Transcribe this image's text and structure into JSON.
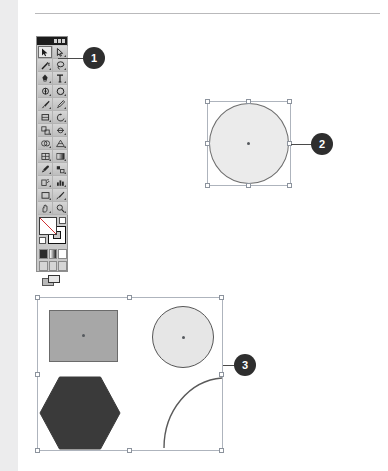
{
  "page": {
    "background": "#ffffff",
    "gutter_color": "#ececed",
    "rule_color": "#b9b9bb"
  },
  "toolbar": {
    "name": "Tools panel",
    "title_bar_color": "#1b1b1b",
    "panel_color": "#c9c9c9",
    "selected_tool": "selection-tool",
    "tools": [
      {
        "row": 0,
        "left": "selection-tool",
        "right": "direct-selection-tool"
      },
      {
        "row": 1,
        "left": "magic-wand-tool",
        "right": "lasso-tool"
      },
      {
        "row": 2,
        "left": "pen-tool",
        "right": "type-tool"
      },
      {
        "row": 3,
        "left": "line-segment-tool",
        "right": "ellipse-tool"
      },
      {
        "row": 4,
        "left": "paintbrush-tool",
        "right": "pencil-tool"
      },
      {
        "row": 5,
        "left": "eraser-tool",
        "right": "rotate-tool"
      },
      {
        "row": 6,
        "left": "scale-tool",
        "right": "width-tool"
      },
      {
        "row": 7,
        "left": "shape-builder-tool",
        "right": "perspective-grid-tool"
      },
      {
        "row": 8,
        "left": "mesh-tool",
        "right": "gradient-tool"
      },
      {
        "row": 9,
        "left": "eyedropper-tool",
        "right": "blend-tool"
      },
      {
        "row": 10,
        "left": "symbol-sprayer-tool",
        "right": "column-graph-tool"
      },
      {
        "row": 11,
        "left": "artboard-tool",
        "right": "slice-tool"
      },
      {
        "row": 12,
        "left": "hand-tool",
        "right": "zoom-tool"
      }
    ],
    "fill_stroke": {
      "fill_label": "Fill: None",
      "stroke_label": "Stroke: Gray"
    },
    "paint_modes": [
      "color-mode",
      "gradient-mode",
      "none-mode"
    ],
    "drawing_modes": [
      "draw-normal",
      "draw-behind",
      "draw-inside"
    ],
    "screen_mode": "change-screen-mode"
  },
  "callouts": [
    {
      "number": "1",
      "target": "selection-tool"
    },
    {
      "number": "2",
      "target": "selected-circle"
    },
    {
      "number": "3",
      "target": "selected-shape-group"
    }
  ],
  "artwork": {
    "circle_selection": {
      "name": "selected-circle",
      "shape": "circle",
      "fill": "#ebebeb",
      "stroke": "#6e6e6e",
      "handles": 8,
      "has_center_point": true
    },
    "group_selection": {
      "name": "selected-shape-group",
      "handles": 8,
      "has_center_point": false,
      "objects": [
        {
          "name": "gray-rectangle",
          "shape": "rectangle",
          "fill": "#a7a7a7",
          "stroke": "#6b6b6b",
          "has_center_point": true
        },
        {
          "name": "light-circle",
          "shape": "circle",
          "fill": "#e6e6e6",
          "stroke": "#565656",
          "has_center_point": true
        },
        {
          "name": "dark-hexagon",
          "shape": "hexagon",
          "fill": "#3a3a3a",
          "stroke": "#3a3a3a",
          "has_center_point": false
        },
        {
          "name": "quarter-arc",
          "shape": "arc",
          "fill": "none",
          "stroke": "#5a5a5a",
          "has_center_point": false
        }
      ]
    }
  }
}
